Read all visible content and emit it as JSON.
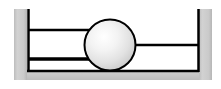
{
  "figure": {
    "width": 221,
    "height": 89,
    "background_color": "#ffffff",
    "caption": ""
  },
  "palette": {
    "background": "#ffffff",
    "wall_gray": "#c6c6c6",
    "wall_gray_light": "#d4d4d4",
    "wall_gray_dark": "#b4b4b4",
    "line_black": "#000000",
    "ball_highlight": "#ffffff",
    "ball_mid": "#e8e8e8",
    "ball_edge": "#b8b8b8",
    "ball_outline": "#000000"
  },
  "chart_data": {
    "type": "diagram",
    "elements": [
      {
        "name": "left-wall-block",
        "shape": "rect",
        "x": 14,
        "y": 9,
        "width": 13,
        "height": 71,
        "fill": "#c6c6c6"
      },
      {
        "name": "right-wall-block",
        "shape": "rect",
        "x": 199,
        "y": 9,
        "width": 13,
        "height": 71,
        "fill": "#c6c6c6"
      },
      {
        "name": "base-block",
        "shape": "rect",
        "x": 14,
        "y": 70,
        "width": 198,
        "height": 10,
        "fill": "#c6c6c6"
      },
      {
        "name": "left-wall-line",
        "shape": "line",
        "x1": 28,
        "y1": 9,
        "x2": 28,
        "y2": 72,
        "stroke": "#000000",
        "stroke_width": 2.5
      },
      {
        "name": "right-wall-line",
        "shape": "line",
        "x1": 198,
        "y1": 9,
        "x2": 198,
        "y2": 72,
        "stroke": "#000000",
        "stroke_width": 2.5
      },
      {
        "name": "floor-line",
        "shape": "line",
        "x1": 27,
        "y1": 71,
        "x2": 199,
        "y2": 71,
        "stroke": "#000000",
        "stroke_width": 2.5
      },
      {
        "name": "upper-left-rod",
        "shape": "line",
        "x1": 28,
        "y1": 30,
        "x2": 92,
        "y2": 30,
        "stroke": "#000000",
        "stroke_width": 2.5
      },
      {
        "name": "lower-left-rod",
        "shape": "line",
        "x1": 28,
        "y1": 59,
        "x2": 92,
        "y2": 59,
        "stroke": "#000000",
        "stroke_width": 3.5
      },
      {
        "name": "right-rod",
        "shape": "line",
        "x1": 130,
        "y1": 45,
        "x2": 198,
        "y2": 45,
        "stroke": "#000000",
        "stroke_width": 2.5
      },
      {
        "name": "ball",
        "shape": "circle",
        "cx": 110,
        "cy": 45,
        "r": 25.5,
        "fill": "radial-gradient",
        "stroke": "#000000",
        "stroke_width": 2
      }
    ],
    "labels": [],
    "annotations": []
  }
}
